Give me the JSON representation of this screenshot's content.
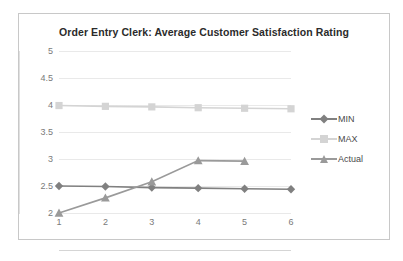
{
  "chart_data": {
    "type": "line",
    "title": "Order Entry Clerk: Average Customer Satisfaction Rating",
    "xlabel": "",
    "ylabel": "",
    "x": [
      1,
      2,
      3,
      4,
      5,
      6
    ],
    "categories": [
      "1",
      "2",
      "3",
      "4",
      "5",
      "6"
    ],
    "xlim": [
      1,
      6
    ],
    "ylim": [
      2,
      5
    ],
    "yticks": [
      2,
      2.5,
      3,
      3.5,
      4,
      4.5,
      5
    ],
    "ytick_labels": [
      "2",
      "2.5",
      "3",
      "3.5",
      "4",
      "4.5",
      "5"
    ],
    "xticks": [
      1,
      2,
      3,
      4,
      5,
      6
    ],
    "xtick_labels": [
      "1",
      "2",
      "3",
      "4",
      "5",
      "6"
    ],
    "grid": "horizontal",
    "legend_position": "right",
    "series": [
      {
        "name": "MIN",
        "marker": "diamond",
        "color": "#808080",
        "values": [
          2.5,
          2.49,
          2.47,
          2.46,
          2.45,
          2.44
        ]
      },
      {
        "name": "MAX",
        "marker": "square",
        "color": "#d4d4d4",
        "values": [
          3.99,
          3.975,
          3.965,
          3.95,
          3.94,
          3.93
        ]
      },
      {
        "name": "Actual",
        "marker": "triangle",
        "color": "#9a9a9a",
        "values": [
          2.0,
          2.28,
          2.58,
          2.97,
          2.96,
          null
        ]
      }
    ]
  },
  "colors": {
    "min_series": "#808080",
    "max_series": "#d4d4d4",
    "actual_series": "#9a9a9a",
    "gridline": "#e9e9e9",
    "frame_border": "#c8c8c8",
    "tick_text": "#7a7a7a",
    "title_text": "#2b2b2b",
    "background": "#ffffff"
  },
  "legend": {
    "entries": [
      {
        "label": "MIN"
      },
      {
        "label": "MAX"
      },
      {
        "label": "Actual"
      }
    ]
  }
}
